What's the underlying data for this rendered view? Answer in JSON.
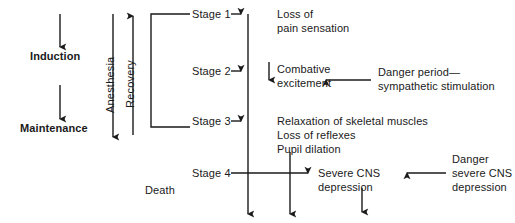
{
  "diagram": {
    "stroke_color": "#1a1a1a",
    "text_color": "#1a1a1a",
    "background": "#ffffff",
    "left_flow": {
      "induction_label": "Induction",
      "maintenance_label": "Maintenance"
    },
    "axes": {
      "anesthesia_label": "Anesthesia",
      "recovery_label": "Recovery"
    },
    "death_label": "Death",
    "stages": [
      {
        "name": "Stage 1",
        "description_lines": [
          "Loss of",
          "pain sensation"
        ]
      },
      {
        "name": "Stage 2",
        "description_lines": [
          "Combative",
          "excitement"
        ]
      },
      {
        "name": "Stage 3",
        "description_lines": [
          "Relaxation of skeletal muscles",
          "Loss of reflexes",
          "Pupil dilation"
        ]
      },
      {
        "name": "Stage 4",
        "description_lines": [
          "Severe CNS",
          "depression"
        ]
      }
    ],
    "annotations": [
      {
        "id": "danger-period",
        "lines": [
          "Danger period—",
          "sympathetic stimulation"
        ]
      },
      {
        "id": "danger-severe-cns",
        "lines": [
          "Danger",
          "severe CNS",
          "depression"
        ]
      }
    ]
  }
}
